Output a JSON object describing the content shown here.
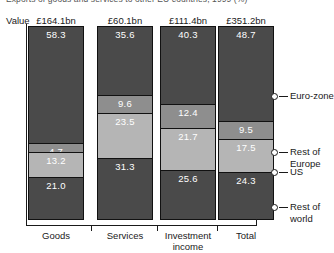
{
  "title_partial": "Exports of goods and services to other EU countries, 1999 (%)",
  "axis": {
    "value_label": "Value"
  },
  "chart_data": {
    "type": "bar",
    "subtype": "stacked-percentage",
    "title": "Exports of goods and services to other EU countries, 1999 (%)",
    "xlabel": "",
    "ylabel": "",
    "ylim": [
      0,
      100
    ],
    "grid": false,
    "legend_position": "right",
    "categories": [
      "Goods",
      "Services",
      "Investment income",
      "Total"
    ],
    "category_values": [
      "£164.1bn",
      "£60.1bn",
      "£111.4bn",
      "£351.2bn"
    ],
    "series": [
      {
        "name": "Euro-zone",
        "color": "#4a4a4a",
        "values": [
          58.3,
          35.6,
          40.3,
          48.7
        ]
      },
      {
        "name": "Rest of Europe",
        "color": "#8e8e8e",
        "values": [
          4.7,
          9.6,
          12.4,
          9.5
        ]
      },
      {
        "name": "US",
        "color": "#b5b5b5",
        "values": [
          13.2,
          23.5,
          21.7,
          17.5
        ]
      },
      {
        "name": "Rest of world",
        "color": "#4a4a4a",
        "values": [
          21.0,
          31.3,
          25.6,
          24.3
        ]
      }
    ],
    "legend": [
      "Euro-zone",
      "Rest of Europe",
      "US",
      "Rest of world"
    ]
  },
  "columns": [
    {
      "category": "Goods",
      "category_line2": "",
      "value": "£164.1bn",
      "segments": [
        {
          "label": "58.3",
          "pct": 58.3,
          "tone": "dark"
        },
        {
          "label": "4.7",
          "pct": 4.7,
          "tone": "mid"
        },
        {
          "label": "13.2",
          "pct": 13.2,
          "tone": "light"
        },
        {
          "label": "21.0",
          "pct": 21.0,
          "tone": "dark"
        }
      ]
    },
    {
      "category": "Services",
      "category_line2": "",
      "value": "£60.1bn",
      "segments": [
        {
          "label": "35.6",
          "pct": 35.6,
          "tone": "dark"
        },
        {
          "label": "9.6",
          "pct": 9.6,
          "tone": "mid"
        },
        {
          "label": "23.5",
          "pct": 23.5,
          "tone": "light"
        },
        {
          "label": "31.3",
          "pct": 31.3,
          "tone": "dark"
        }
      ]
    },
    {
      "category": "Investment",
      "category_line2": "income",
      "value": "£111.4bn",
      "segments": [
        {
          "label": "40.3",
          "pct": 40.3,
          "tone": "dark"
        },
        {
          "label": "12.4",
          "pct": 12.4,
          "tone": "mid"
        },
        {
          "label": "21.7",
          "pct": 21.7,
          "tone": "light"
        },
        {
          "label": "25.6",
          "pct": 25.6,
          "tone": "dark"
        }
      ]
    },
    {
      "category": "Total",
      "category_line2": "",
      "value": "£351.2bn",
      "segments": [
        {
          "label": "48.7",
          "pct": 48.7,
          "tone": "dark"
        },
        {
          "label": "9.5",
          "pct": 9.5,
          "tone": "mid"
        },
        {
          "label": "17.5",
          "pct": 17.5,
          "tone": "light"
        },
        {
          "label": "24.3",
          "pct": 24.3,
          "tone": "dark"
        }
      ]
    }
  ],
  "callouts": [
    {
      "label_line1": "Euro-zone",
      "label_line2": "",
      "y": 96
    },
    {
      "label_line1": "Rest of",
      "label_line2": "Europe",
      "y": 152
    },
    {
      "label_line1": "US",
      "label_line2": "",
      "y": 172
    },
    {
      "label_line1": "Rest of",
      "label_line2": "world",
      "y": 207
    }
  ],
  "colors": {
    "euro_zone": "#4a4a4a",
    "rest_of_europe": "#8e8e8e",
    "us": "#b5b5b5",
    "rest_of_world": "#4a4a4a",
    "axis": "#1a1a1a",
    "background": "#ffffff"
  }
}
